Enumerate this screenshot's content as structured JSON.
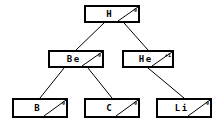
{
  "diagram": {
    "type": "binary-tree",
    "background_color": "#ffffff",
    "line_color": "#000000",
    "node_fill": "#ffffff",
    "nodes": [
      {
        "id": "h",
        "label": "H",
        "corner_value": "0",
        "x": 84,
        "y": 5,
        "w": 56,
        "h": 18
      },
      {
        "id": "be",
        "label": "Be",
        "corner_value": "0",
        "x": 48,
        "y": 50,
        "w": 56,
        "h": 18
      },
      {
        "id": "he",
        "label": "He",
        "corner_value": "+1",
        "x": 122,
        "y": 50,
        "w": 52,
        "h": 18
      },
      {
        "id": "b",
        "label": "B",
        "corner_value": "0",
        "x": 12,
        "y": 98,
        "w": 56,
        "h": 20
      },
      {
        "id": "c",
        "label": "C",
        "corner_value": "0",
        "x": 84,
        "y": 98,
        "w": 56,
        "h": 20
      },
      {
        "id": "li",
        "label": "Li",
        "corner_value": "0",
        "x": 156,
        "y": 98,
        "w": 56,
        "h": 20
      }
    ],
    "edges": [
      {
        "id": "h-be",
        "from": "h",
        "to": "be",
        "x1": 104,
        "y1": 23,
        "x2": 76,
        "y2": 50
      },
      {
        "id": "h-he",
        "from": "h",
        "to": "he",
        "x1": 124,
        "y1": 23,
        "x2": 148,
        "y2": 50
      },
      {
        "id": "be-b",
        "from": "be",
        "to": "b",
        "x1": 64,
        "y1": 68,
        "x2": 40,
        "y2": 98
      },
      {
        "id": "be-c",
        "from": "be",
        "to": "c",
        "x1": 88,
        "y1": 68,
        "x2": 112,
        "y2": 98
      },
      {
        "id": "he-li",
        "from": "he",
        "to": "li",
        "x1": 148,
        "y1": 68,
        "x2": 184,
        "y2": 98
      }
    ]
  }
}
